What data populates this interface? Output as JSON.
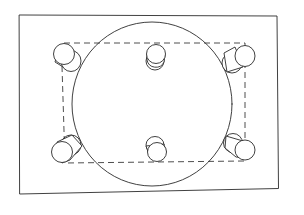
{
  "diagram": {
    "title": "Hand-drawn sketch: rectangle frame with large circle, dashed rectangle and six cylinders",
    "colors": {
      "background": "#ffffff",
      "line": "#2b2b2b"
    },
    "frame": {
      "shape": "rectangle",
      "style": "solid"
    },
    "circle": {
      "shape": "circle",
      "style": "solid"
    },
    "dashed_rect": {
      "shape": "rectangle",
      "style": "dashed"
    },
    "cylinders": [
      {
        "position": "top-left"
      },
      {
        "position": "top-center"
      },
      {
        "position": "top-right"
      },
      {
        "position": "bottom-left"
      },
      {
        "position": "bottom-center"
      },
      {
        "position": "bottom-right"
      }
    ]
  }
}
